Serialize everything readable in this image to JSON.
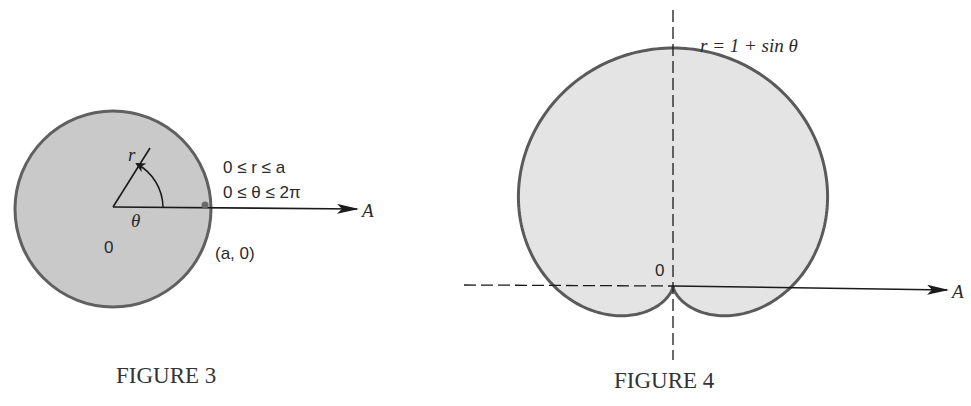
{
  "figures": [
    {
      "caption": "FIGURE 3",
      "description": "Disk of radius a centered at the pole",
      "labels": {
        "pole": "0",
        "radius": "r",
        "angle": "θ",
        "point": "(a, 0)",
        "axis": "A",
        "constraint_r": "0 ≤ r ≤ a",
        "constraint_theta": "0 ≤ θ ≤ 2π"
      }
    },
    {
      "caption": "FIGURE 4",
      "description": "Cardioid region",
      "labels": {
        "equation": "r = 1 + sin θ",
        "pole": "0",
        "axis": "A"
      }
    }
  ],
  "colors": {
    "fill_fig3": "#c9c9c9",
    "fill_fig4": "#e4e4e4",
    "stroke": "#555555",
    "axis": "#1a1a1a"
  }
}
